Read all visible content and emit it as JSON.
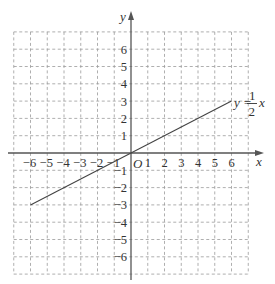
{
  "chart_data": {
    "type": "line",
    "title": "",
    "xlabel": "x",
    "ylabel": "y",
    "origin_label": "O",
    "xlim": [
      -7,
      7
    ],
    "ylim": [
      -7,
      7
    ],
    "grid": true,
    "grid_style": "dashed",
    "x_ticks": [
      "-6",
      "-5",
      "-4",
      "-3",
      "-2",
      "-1",
      "1",
      "2",
      "3",
      "4",
      "5",
      "6"
    ],
    "y_ticks": [
      "6",
      "5",
      "4",
      "3",
      "2",
      "1",
      "-1",
      "-2",
      "-3",
      "-4",
      "-5",
      "-6"
    ],
    "series": [
      {
        "name": "y = 1/2 x",
        "equation": "y = (1/2) x",
        "x": [
          -6,
          6
        ],
        "y": [
          -3,
          3
        ]
      }
    ],
    "annotations": [
      {
        "text": "y = 1/2 x",
        "position": [
          6,
          3
        ]
      }
    ]
  },
  "labels": {
    "x_axis": "x",
    "y_axis": "y",
    "origin": "O",
    "eq_lhs": "y =",
    "eq_num": "1",
    "eq_den": "2",
    "eq_var": "x"
  },
  "colors": {
    "axis": "#555555",
    "grid": "#9a9a9a",
    "line": "#444444",
    "text": "#333333"
  }
}
